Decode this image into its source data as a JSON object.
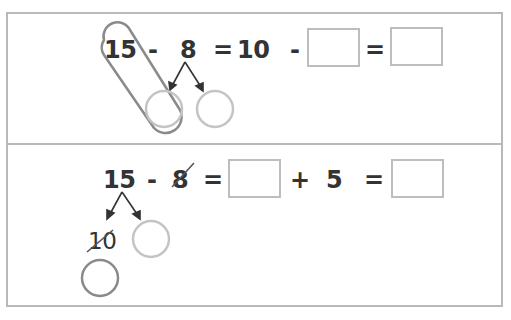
{
  "problem1": {
    "n1": "15",
    "op1": "-",
    "n2": "8",
    "eq1": "=",
    "n3": "10",
    "op2": "-",
    "eq2": "=",
    "answer_box_1": "",
    "answer_box_2": "",
    "decompose_circle_left": "",
    "decompose_circle_right": ""
  },
  "problem2": {
    "n1": "15",
    "op1": "-",
    "n2": "8",
    "eq1": "=",
    "op2": "+",
    "n3": "5",
    "eq2": "=",
    "split_ten": "10",
    "answer_box_1": "",
    "answer_box_2": "",
    "split_circle": "",
    "result_circle": ""
  },
  "colors": {
    "text": "#333333",
    "box_border": "#bdbdbd",
    "panel_border": "#b9b9b9",
    "dark_circle": "#8a8a8a",
    "light_circle": "#c4c4c4"
  }
}
